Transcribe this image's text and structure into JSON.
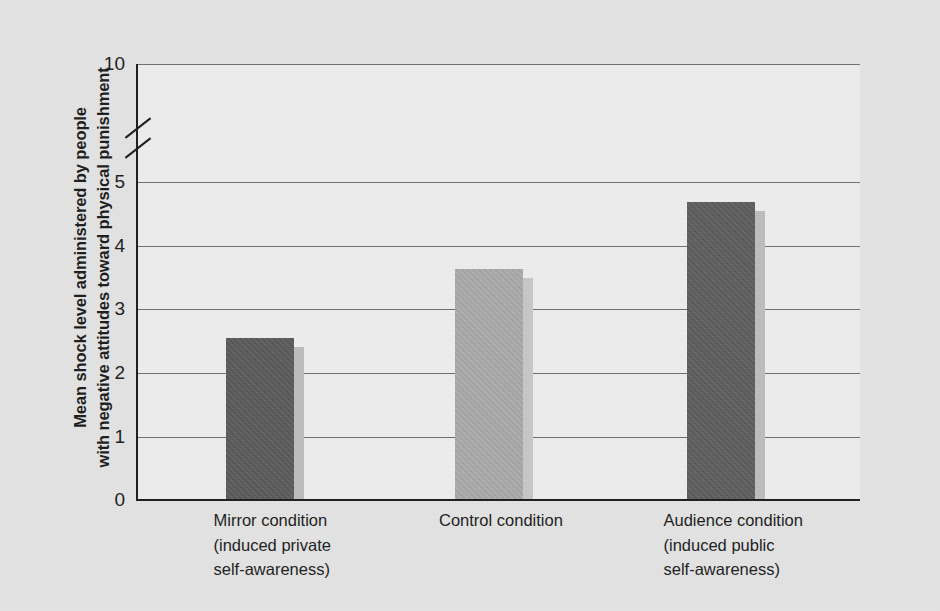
{
  "chart_data": {
    "type": "bar",
    "title": "",
    "xlabel": "",
    "ylabel_lines": [
      "Mean shock level administered by people",
      "with negative attitudes toward physical punishment"
    ],
    "ylabel": "Mean shock level administered by people with negative attitudes toward physical punishment",
    "categories": [
      "Mirror condition (induced private self-awareness)",
      "Control condition",
      "Audience condition (induced public self-awareness)"
    ],
    "category_label_lines": [
      [
        "Mirror condition",
        "(induced private",
        "self-awareness)"
      ],
      [
        "Control condition"
      ],
      [
        "Audience condition",
        "(induced public",
        "self-awareness)"
      ]
    ],
    "values": [
      2.55,
      3.65,
      4.72
    ],
    "bar_colors": [
      "#595959",
      "#a9a9a9",
      "#5c5c5c"
    ],
    "bar_shadow_colors": [
      "#bcbcbc",
      "#c6c6c6",
      "#bcbcbc"
    ],
    "ylim": [
      0,
      5
    ],
    "ytick_labels": [
      "0",
      "1",
      "2",
      "3",
      "4",
      "5",
      "10"
    ],
    "ytick_values": [
      0,
      1,
      2,
      3,
      4,
      5,
      10
    ],
    "grid": true,
    "gridlines_at": [
      1,
      2,
      3,
      4,
      5,
      10
    ],
    "axis_break": {
      "present": true,
      "between": [
        5,
        10
      ],
      "style": "double-slash"
    },
    "legend": null,
    "legend_position": "none",
    "axis_color": "#1c1c1c",
    "grid_color": "#6d6d6d",
    "plot_background": "#ececec",
    "figure_background": "#e2e2e2"
  }
}
